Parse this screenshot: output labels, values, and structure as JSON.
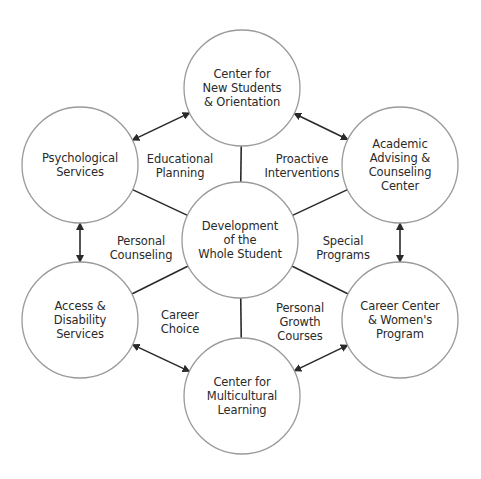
{
  "colors": {
    "circle_stroke": "#9a9a9a",
    "line": "#2a2a2a",
    "text": "#2a2a2a",
    "background": "#ffffff"
  },
  "center": {
    "label": "Development\nof the\nWhole Student",
    "x": 240,
    "y": 240,
    "r": 58
  },
  "nodes": [
    {
      "id": "top",
      "label": "Center for\nNew Students\n& Orientation",
      "x": 242,
      "y": 88,
      "r": 58
    },
    {
      "id": "upper-right",
      "label": "Academic\nAdvising &\nCounseling\nCenter",
      "x": 400,
      "y": 165,
      "r": 58
    },
    {
      "id": "lower-right",
      "label": "Career Center\n& Women's\nProgram",
      "x": 400,
      "y": 320,
      "r": 58
    },
    {
      "id": "bottom",
      "label": "Center for\nMulticultural\nLearning",
      "x": 242,
      "y": 396,
      "r": 58
    },
    {
      "id": "lower-left",
      "label": "Access &\nDisability\nServices",
      "x": 80,
      "y": 320,
      "r": 58
    },
    {
      "id": "upper-left",
      "label": "Psychological\nServices",
      "x": 80,
      "y": 165,
      "r": 58
    }
  ],
  "spoke_labels": [
    {
      "label": "Educational\nPlanning",
      "x": 180,
      "y": 166
    },
    {
      "label": "Proactive\nInterventions",
      "x": 302,
      "y": 166
    },
    {
      "label": "Special\nPrograms",
      "x": 343,
      "y": 248
    },
    {
      "label": "Personal\nGrowth\nCourses",
      "x": 300,
      "y": 322
    },
    {
      "label": "Career\nChoice",
      "x": 180,
      "y": 322
    },
    {
      "label": "Personal\nCounseling",
      "x": 141,
      "y": 248
    }
  ]
}
